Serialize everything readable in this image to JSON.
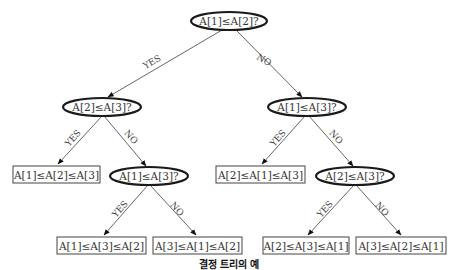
{
  "diagram": {
    "type": "decision-tree",
    "caption": "결정 트리의 예",
    "edge_labels": {
      "yes": "YES",
      "no": "NO"
    },
    "nodes": {
      "root": {
        "kind": "decision",
        "label": "A[1]≤A[2]?"
      },
      "l2_left": {
        "kind": "decision",
        "label": "A[2]≤A[3]?"
      },
      "l2_right": {
        "kind": "decision",
        "label": "A[1]≤A[3]?"
      },
      "l3_leaf_a": {
        "kind": "leaf",
        "label": "A[1]≤A[2]≤A[3]"
      },
      "l3_dec_b": {
        "kind": "decision",
        "label": "A[1]≤A[3]?"
      },
      "l3_leaf_c": {
        "kind": "leaf",
        "label": "A[2]≤A[1]≤A[3]"
      },
      "l3_dec_d": {
        "kind": "decision",
        "label": "A[2]≤A[3]?"
      },
      "l4_leaf_1": {
        "kind": "leaf",
        "label": "A[1]≤A[3]≤A[2]"
      },
      "l4_leaf_2": {
        "kind": "leaf",
        "label": "A[3]≤A[1]≤A[2]"
      },
      "l4_leaf_3": {
        "kind": "leaf",
        "label": "A[2]≤A[3]≤A[1]"
      },
      "l4_leaf_4": {
        "kind": "leaf",
        "label": "A[3]≤A[2]≤A[1]"
      }
    },
    "edges": [
      {
        "from": "root",
        "to": "l2_left",
        "label": "YES"
      },
      {
        "from": "root",
        "to": "l2_right",
        "label": "NO"
      },
      {
        "from": "l2_left",
        "to": "l3_leaf_a",
        "label": "YES"
      },
      {
        "from": "l2_left",
        "to": "l3_dec_b",
        "label": "NO"
      },
      {
        "from": "l2_right",
        "to": "l3_leaf_c",
        "label": "YES"
      },
      {
        "from": "l2_right",
        "to": "l3_dec_d",
        "label": "NO"
      },
      {
        "from": "l3_dec_b",
        "to": "l4_leaf_1",
        "label": "YES"
      },
      {
        "from": "l3_dec_b",
        "to": "l4_leaf_2",
        "label": "NO"
      },
      {
        "from": "l3_dec_d",
        "to": "l4_leaf_3",
        "label": "YES"
      },
      {
        "from": "l3_dec_d",
        "to": "l4_leaf_4",
        "label": "NO"
      }
    ]
  }
}
